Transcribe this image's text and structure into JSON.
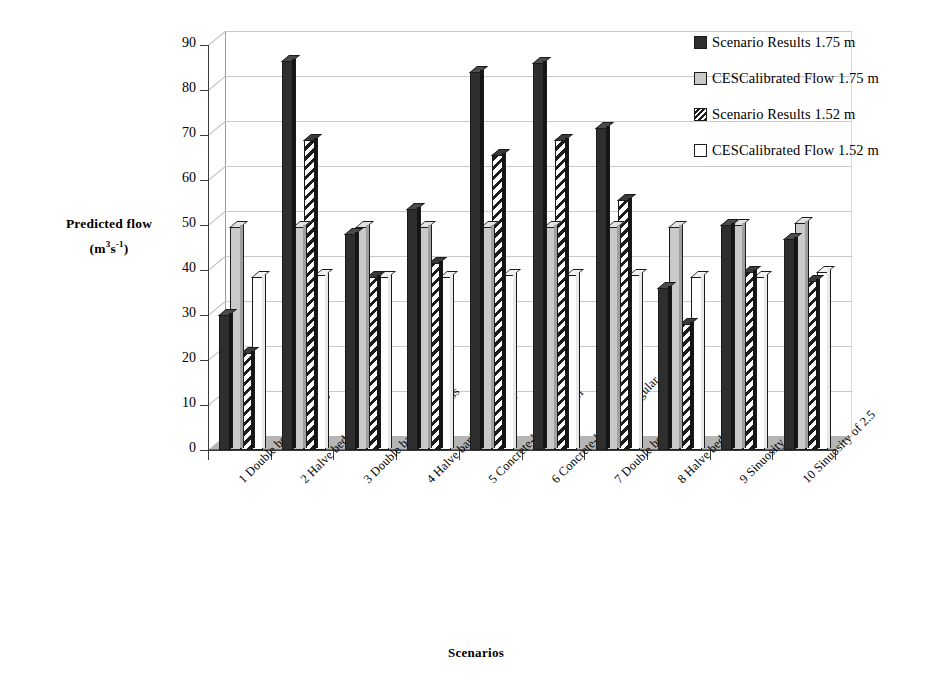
{
  "chart_data": {
    "type": "bar",
    "title": "",
    "xlabel": "Scenarios",
    "ylabel": "Predicted flow (m³s⁻¹)",
    "ylim": [
      0,
      90
    ],
    "yticks": [
      0,
      10,
      20,
      30,
      40,
      50,
      60,
      70,
      80,
      90
    ],
    "grid": true,
    "legend_position": "right",
    "categories": [
      "1 Double bed roughness",
      "2 Halve bed roughness",
      "3 Double bank roughness",
      "4 Halve bank roughness",
      "5 Concrete-lined channel",
      "6 Concrete-lined rectangular",
      "7 Double bed slope",
      "8 Halve bed slope",
      "9 Sinuosity of 1.5",
      "10 Sinuosity of 2.5"
    ],
    "series": [
      {
        "name": "Scenario Results 1.75 m",
        "style": "solid-dark",
        "color": "#2e2e2e",
        "values": [
          30.0,
          86.5,
          48.0,
          53.5,
          84.0,
          86.0,
          71.5,
          36.0,
          50.0,
          47.0
        ]
      },
      {
        "name": "CESCalibrated Flow 1.75 m",
        "style": "solid-light",
        "color": "#c9c9c9",
        "values": [
          49.5,
          49.5,
          49.5,
          49.5,
          49.5,
          49.5,
          49.5,
          49.5,
          50.0,
          50.5
        ]
      },
      {
        "name": "Scenario Results 1.52 m",
        "style": "hatched",
        "color": "#1d1d1d",
        "values": [
          21.5,
          69.0,
          38.5,
          41.5,
          65.5,
          69.0,
          55.5,
          28.0,
          39.5,
          37.5
        ]
      },
      {
        "name": "CESCalibrated Flow 1.52 m",
        "style": "open-white",
        "color": "#ffffff",
        "values": [
          38.5,
          39.0,
          38.5,
          38.5,
          39.0,
          39.0,
          39.0,
          38.5,
          38.5,
          39.5
        ]
      }
    ]
  },
  "axes": {
    "y_title_line1": "Predicted flow",
    "y_title_line2_open": "(m",
    "y_title_line2_sup1": "3",
    "y_title_line2_mid": "s",
    "y_title_line2_sup2": "-1",
    "y_title_line2_close": ")",
    "x_title": "Scenarios"
  },
  "legend": {
    "items": [
      {
        "label": "Scenario Results 1.75 m",
        "swatch": "solid-dark"
      },
      {
        "label": "CESCalibrated Flow 1.75 m",
        "swatch": "solid-light"
      },
      {
        "label": "Scenario Results 1.52 m",
        "swatch": "hatched"
      },
      {
        "label": "CESCalibrated Flow 1.52 m",
        "swatch": "open-white"
      }
    ]
  }
}
